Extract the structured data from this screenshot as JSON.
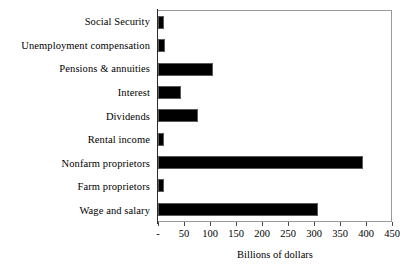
{
  "chart_data": {
    "type": "bar",
    "orientation": "horizontal",
    "title": "",
    "xlabel": "Billions of dollars",
    "ylabel": "",
    "categories": [
      "Social Security",
      "Unemployment compensation",
      "Pensions & annuities",
      "Interest",
      "Dividends",
      "Rental income",
      "Nonfarm proprietors",
      "Farm proprietors",
      "Wage and salary"
    ],
    "values": [
      12,
      13,
      105,
      45,
      77,
      12,
      395,
      12,
      308
    ],
    "xlim": [
      0,
      450
    ],
    "xticks": [
      0,
      50,
      100,
      150,
      200,
      250,
      300,
      350,
      400,
      450
    ],
    "xtick_labels": [
      "-",
      "50",
      "100",
      "150",
      "200",
      "250",
      "300",
      "350",
      "400",
      "450"
    ],
    "grid": false,
    "legend": null,
    "bar_color": "#000000",
    "bar_edge_color": "#5a5a5a",
    "axis_color": "#9a9a9a",
    "background": "#ffffff"
  }
}
